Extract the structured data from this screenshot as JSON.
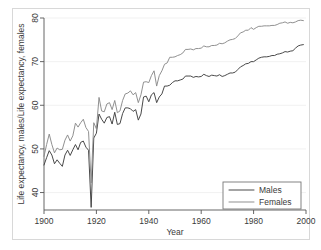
{
  "figure": {
    "background_color": "#ffffff",
    "border_color": "#d8d8d8"
  },
  "chart_data": {
    "type": "line",
    "title": "",
    "xlabel": "Year",
    "ylabel": "Life expectancy, males/Life expectancy, females",
    "xlim": [
      1900,
      2000
    ],
    "ylim": [
      36,
      80
    ],
    "xticks": [
      1900,
      1920,
      1940,
      1960,
      1980,
      2000
    ],
    "xtick_labels": [
      "1900",
      "1920",
      "1940",
      "1960",
      "1980",
      "2000"
    ],
    "yticks": [
      40,
      50,
      60,
      70,
      80
    ],
    "ytick_labels": [
      "40",
      "50",
      "60",
      "70",
      "80"
    ],
    "grid": true,
    "grid_axis": "y",
    "legend_position": "lower right",
    "legend_entries": [
      "Males",
      "Females"
    ],
    "colors": {
      "males": "#3f3f3f",
      "females": "#8a8a8a"
    },
    "x": [
      1900,
      1901,
      1902,
      1903,
      1904,
      1905,
      1906,
      1907,
      1908,
      1909,
      1910,
      1911,
      1912,
      1913,
      1914,
      1915,
      1916,
      1917,
      1918,
      1919,
      1920,
      1921,
      1922,
      1923,
      1924,
      1925,
      1926,
      1927,
      1928,
      1929,
      1930,
      1931,
      1932,
      1933,
      1934,
      1935,
      1936,
      1937,
      1938,
      1939,
      1940,
      1941,
      1942,
      1943,
      1944,
      1945,
      1946,
      1947,
      1948,
      1949,
      1950,
      1951,
      1952,
      1953,
      1954,
      1955,
      1956,
      1957,
      1958,
      1959,
      1960,
      1961,
      1962,
      1963,
      1964,
      1965,
      1966,
      1967,
      1968,
      1969,
      1970,
      1971,
      1972,
      1973,
      1974,
      1975,
      1976,
      1977,
      1978,
      1979,
      1980,
      1981,
      1982,
      1983,
      1984,
      1985,
      1986,
      1987,
      1988,
      1989,
      1990,
      1991,
      1992,
      1993,
      1994,
      1995,
      1996,
      1997,
      1998,
      1999
    ],
    "series": [
      {
        "name": "Males",
        "values": [
          46.3,
          48.0,
          49.6,
          48.6,
          46.6,
          47.5,
          46.7,
          46.0,
          48.6,
          49.7,
          48.5,
          49.8,
          51.0,
          49.8,
          51.5,
          51.8,
          50.4,
          49.7,
          36.6,
          52.5,
          53.6,
          58.0,
          56.8,
          55.9,
          57.2,
          57.4,
          55.7,
          58.4,
          55.6,
          55.8,
          58.1,
          59.4,
          59.4,
          59.2,
          58.6,
          59.0,
          56.6,
          58.0,
          61.9,
          62.1,
          60.8,
          62.4,
          62.9,
          60.6,
          61.9,
          62.6,
          64.4,
          64.4,
          64.6,
          65.2,
          65.6,
          65.6,
          65.8,
          66.0,
          66.7,
          66.7,
          66.7,
          66.4,
          66.6,
          66.5,
          66.6,
          67.1,
          66.8,
          66.6,
          66.9,
          66.8,
          66.7,
          67.0,
          66.6,
          66.8,
          67.1,
          67.4,
          67.4,
          67.6,
          68.2,
          68.8,
          69.1,
          69.5,
          69.6,
          70.0,
          70.0,
          70.4,
          70.8,
          71.0,
          71.1,
          71.1,
          71.2,
          71.4,
          71.4,
          71.7,
          71.8,
          72.0,
          72.3,
          72.2,
          72.4,
          72.5,
          73.1,
          73.6,
          73.8,
          73.9
        ]
      },
      {
        "name": "Females",
        "values": [
          48.3,
          51.0,
          53.4,
          51.0,
          49.1,
          50.2,
          49.8,
          49.9,
          52.0,
          53.2,
          51.8,
          53.0,
          55.9,
          55.0,
          56.0,
          56.8,
          54.9,
          54.0,
          42.2,
          56.0,
          54.6,
          61.8,
          58.7,
          58.5,
          60.3,
          60.6,
          59.0,
          61.1,
          58.3,
          58.7,
          61.1,
          62.6,
          62.8,
          63.3,
          62.4,
          62.9,
          60.6,
          62.4,
          65.3,
          65.4,
          65.2,
          66.8,
          67.9,
          64.4,
          66.8,
          67.9,
          69.4,
          69.7,
          71.0,
          71.0,
          71.1,
          71.4,
          71.6,
          72.0,
          72.8,
          72.8,
          72.9,
          72.7,
          73.0,
          73.0,
          73.1,
          73.6,
          73.4,
          73.4,
          73.7,
          73.7,
          73.8,
          74.2,
          74.1,
          74.3,
          74.7,
          75.0,
          75.1,
          75.3,
          75.9,
          76.6,
          76.8,
          77.2,
          77.2,
          77.8,
          77.4,
          77.8,
          78.1,
          78.1,
          78.2,
          78.2,
          78.2,
          78.3,
          78.3,
          78.5,
          78.8,
          78.9,
          79.1,
          78.8,
          79.0,
          78.9,
          79.1,
          79.4,
          79.5,
          79.4
        ]
      }
    ]
  }
}
